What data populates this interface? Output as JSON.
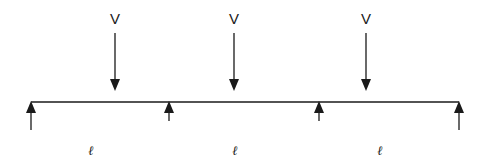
{
  "diagram": {
    "type": "continuous-beam",
    "stroke_color": "#1a1a1a",
    "background": "#ffffff",
    "beam": {
      "x1": 31,
      "x2": 459,
      "y": 102
    },
    "loads": [
      {
        "label": "V",
        "x": 115
      },
      {
        "label": "V",
        "x": 234
      },
      {
        "label": "V",
        "x": 366
      }
    ],
    "supports": [
      {
        "x": 31,
        "tail_y": 130,
        "kind": "end"
      },
      {
        "x": 169,
        "tail_y": 121,
        "kind": "intermediate"
      },
      {
        "x": 319,
        "tail_y": 121,
        "kind": "intermediate"
      },
      {
        "x": 459,
        "tail_y": 130,
        "kind": "end"
      }
    ],
    "spans": [
      {
        "label": "ℓ",
        "x": 91
      },
      {
        "label": "ℓ",
        "x": 235
      },
      {
        "label": "ℓ",
        "x": 380
      }
    ]
  }
}
